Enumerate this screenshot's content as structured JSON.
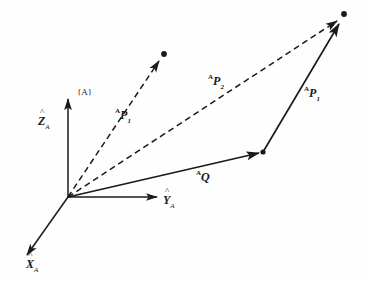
{
  "figure": {
    "background_color": "#fefefe",
    "ink_color": "#1a1a1a",
    "width": 365,
    "height": 282
  },
  "frame": {
    "label": "{A}",
    "origin": {
      "x": 68,
      "y": 197
    }
  },
  "axes": [
    {
      "name": "z-axis",
      "letter": "Z",
      "hat": "^",
      "subscript": "A",
      "label": "Ẑ_A",
      "from": {
        "x": 68,
        "y": 197
      },
      "to": {
        "x": 68,
        "y": 96
      }
    },
    {
      "name": "y-axis",
      "letter": "Y",
      "hat": "^",
      "subscript": "A",
      "label": "Ŷ_A",
      "from": {
        "x": 68,
        "y": 197
      },
      "to": {
        "x": 160,
        "y": 197
      }
    },
    {
      "name": "x-axis",
      "letter": "X",
      "hat": "^",
      "subscript": "A",
      "label": "X̂_A",
      "from": {
        "x": 68,
        "y": 197
      },
      "to": {
        "x": 24,
        "y": 259
      }
    }
  ],
  "vectors": [
    {
      "name": "vector-ap1-from-origin",
      "prefix": "A",
      "base": "P",
      "subscript": "1",
      "label": "ᴬP₁",
      "style": "dashed",
      "from": {
        "x": 68,
        "y": 197
      },
      "to": {
        "x": 163,
        "y": 55
      },
      "endpoint_dot": true
    },
    {
      "name": "vector-ap2",
      "prefix": "A",
      "base": "P",
      "subscript": "2",
      "label": "ᴬP₂",
      "style": "dashed",
      "from": {
        "x": 68,
        "y": 197
      },
      "to": {
        "x": 343,
        "y": 17
      },
      "endpoint_dot": true
    },
    {
      "name": "vector-aq",
      "prefix": "A",
      "base": "Q",
      "subscript": "",
      "label": "ᴬQ",
      "style": "solid",
      "from": {
        "x": 68,
        "y": 197
      },
      "to": {
        "x": 263,
        "y": 152
      },
      "endpoint_dot": true
    },
    {
      "name": "vector-ap1-from-q",
      "prefix": "A",
      "base": "P",
      "subscript": "1",
      "label": "ᴬP₁",
      "style": "solid",
      "from": {
        "x": 263,
        "y": 152
      },
      "to": {
        "x": 343,
        "y": 17
      },
      "endpoint_dot": true
    }
  ],
  "labels": {
    "ap1_lower": {
      "prefix": "A",
      "base": "P",
      "sub": "1"
    },
    "ap2": {
      "prefix": "A",
      "base": "P",
      "sub": "2"
    },
    "ap1_right": {
      "prefix": "A",
      "base": "P",
      "sub": "1"
    },
    "aq": {
      "prefix": "A",
      "base": "Q",
      "sub": ""
    },
    "frame": "{A}",
    "z_axis": {
      "letter": "Z",
      "sub": "A"
    },
    "y_axis": {
      "letter": "Y",
      "sub": "A"
    },
    "x_axis": {
      "letter": "X",
      "sub": "A"
    }
  }
}
